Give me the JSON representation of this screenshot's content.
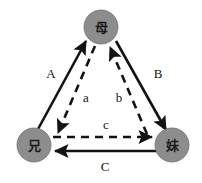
{
  "diagram": {
    "type": "directed-graph",
    "background_color": "#ffffff",
    "node_fill_color": "#8d8d8d",
    "edge_color": "#131313",
    "nodes": [
      {
        "id": "mother",
        "label": "母",
        "x": 101,
        "y": 27,
        "r": 17
      },
      {
        "id": "elder-brother",
        "label": "兄",
        "x": 34,
        "y": 145,
        "r": 17
      },
      {
        "id": "younger-sister",
        "label": "妹",
        "x": 172,
        "y": 145,
        "r": 17
      }
    ],
    "edges": [
      {
        "id": "edge-A",
        "label": "A",
        "style": "solid",
        "from": "elder-brother",
        "to": "mother",
        "label_x": 51,
        "label_y": 73
      },
      {
        "id": "edge-a",
        "label": "a",
        "style": "dashed",
        "from": "mother",
        "to": "elder-brother",
        "label_x": 86,
        "label_y": 97
      },
      {
        "id": "edge-B",
        "label": "B",
        "style": "solid",
        "from": "mother",
        "to": "younger-sister",
        "label_x": 158,
        "label_y": 73
      },
      {
        "id": "edge-b",
        "label": "b",
        "style": "dashed",
        "from": "younger-sister",
        "to": "mother",
        "label_x": 119,
        "label_y": 97
      },
      {
        "id": "edge-c",
        "label": "c",
        "style": "dashed",
        "from": "elder-brother",
        "to": "younger-sister",
        "label_x": 106,
        "label_y": 124
      },
      {
        "id": "edge-C",
        "label": "C",
        "style": "solid",
        "from": "younger-sister",
        "to": "elder-brother",
        "label_x": 105,
        "label_y": 166
      }
    ]
  }
}
